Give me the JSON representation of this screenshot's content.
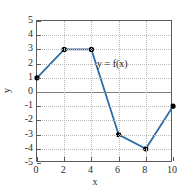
{
  "chart_data": {
    "type": "line",
    "title": "",
    "xlabel": "x",
    "ylabel": "y",
    "annotation": "y = f(x)",
    "x": [
      0,
      2,
      4,
      6,
      8,
      10
    ],
    "values": [
      1,
      3,
      3,
      -3,
      -4,
      -1
    ],
    "series": [
      {
        "name": "f(x)",
        "x": [
          0,
          2,
          4,
          6,
          8,
          10
        ],
        "values": [
          1,
          3,
          3,
          -3,
          -4,
          -1
        ]
      }
    ],
    "xlim": [
      0,
      10
    ],
    "ylim": [
      -5,
      5
    ],
    "xticks": [
      0,
      2,
      4,
      6,
      8,
      10
    ],
    "yticks": [
      5,
      4,
      3,
      2,
      1,
      0,
      -1,
      -2,
      -3,
      -4,
      -5
    ],
    "xtick_labels": [
      "0",
      "2",
      "4",
      "6",
      "8",
      "10"
    ],
    "ytick_labels": [
      "5",
      "4",
      "3",
      "2",
      "1",
      "0",
      "-1",
      "-2",
      "-3",
      "-4",
      "-5"
    ],
    "grid": true,
    "legend": null,
    "line_color": "#2e6da8",
    "marker_color": "#000000",
    "marker": "circle",
    "zero_line_color": "#7d7d7d",
    "grid_color": "#b9b9b9",
    "frame_color": "#5b5b5b",
    "background": "#ffffff"
  }
}
